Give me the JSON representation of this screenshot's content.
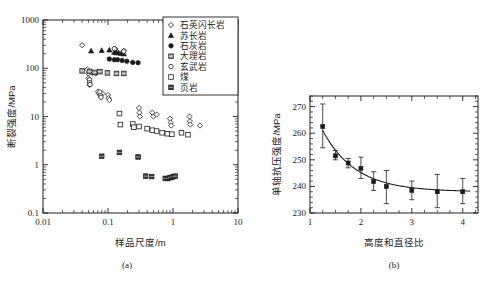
{
  "figure": {
    "panel_a_caption": "(a)",
    "panel_b_caption": "(b)"
  },
  "chart_data": [
    {
      "id": "panel_a",
      "type": "scatter",
      "title": "",
      "xlabel": "样品尺度/m",
      "ylabel": "断裂强度/MPa",
      "xscale": "log",
      "yscale": "log",
      "xlim": [
        0.01,
        10
      ],
      "ylim": [
        0.1,
        1000
      ],
      "xticklabels": [
        "0.01",
        "0.1",
        "1",
        "10"
      ],
      "xtickvalues": [
        0.01,
        0.1,
        1,
        10
      ],
      "yticklabels": [
        "1000",
        "100",
        "10",
        "1",
        "0.1"
      ],
      "ytickvalues": [
        1000,
        100,
        10,
        1,
        0.1
      ],
      "grid": false,
      "legend_position": "top-right",
      "series": [
        {
          "name": "石英闪长岩",
          "marker": "open-diamond",
          "points": [
            [
              0.04,
              300
            ],
            [
              0.048,
              95
            ],
            [
              0.05,
              78
            ],
            [
              0.05,
              62
            ],
            [
              0.052,
              52
            ],
            [
              0.052,
              45
            ],
            [
              0.055,
              85
            ],
            [
              0.058,
              80
            ],
            [
              0.065,
              78
            ],
            [
              0.07,
              33
            ],
            [
              0.072,
              30
            ],
            [
              0.075,
              28
            ],
            [
              0.082,
              30
            ],
            [
              0.1,
              28
            ],
            [
              0.102,
              24
            ],
            [
              0.105,
              22
            ],
            [
              0.13,
              250
            ],
            [
              0.175,
              230
            ],
            [
              0.3,
              15
            ],
            [
              0.305,
              12
            ],
            [
              0.31,
              10
            ],
            [
              0.48,
              12
            ],
            [
              0.5,
              10
            ],
            [
              0.56,
              11
            ],
            [
              0.9,
              9
            ],
            [
              0.92,
              7.5
            ],
            [
              0.94,
              6.5
            ],
            [
              1.8,
              10
            ],
            [
              1.82,
              8
            ],
            [
              1.85,
              6.8
            ],
            [
              2.6,
              6.5
            ]
          ]
        },
        {
          "name": "苏长岩",
          "marker": "filled-triangle",
          "points": [
            [
              0.055,
              230
            ],
            [
              0.08,
              235
            ],
            [
              0.105,
              240
            ],
            [
              0.125,
              215
            ],
            [
              0.135,
              210
            ],
            [
              0.145,
              212
            ],
            [
              0.16,
              205
            ],
            [
              0.175,
              200
            ]
          ]
        },
        {
          "name": "石灰岩",
          "marker": "filled-circle",
          "points": [
            [
              0.105,
              155
            ],
            [
              0.125,
              150
            ],
            [
              0.14,
              150
            ],
            [
              0.165,
              145
            ],
            [
              0.195,
              140
            ],
            [
              0.24,
              132
            ],
            [
              0.29,
              130
            ]
          ]
        },
        {
          "name": "大理岩",
          "marker": "hatched-square",
          "points": [
            [
              0.04,
              88
            ],
            [
              0.052,
              86
            ],
            [
              0.062,
              82
            ],
            [
              0.075,
              85
            ],
            [
              0.098,
              80
            ],
            [
              0.135,
              78
            ],
            [
              0.175,
              78
            ]
          ]
        },
        {
          "name": "玄武岩",
          "marker": "open-circle",
          "points": [
            [
              0.125,
              255
            ],
            [
              0.175,
              225
            ],
            [
              0.052,
              58
            ],
            [
              0.052,
              50
            ],
            [
              0.053,
              46
            ],
            [
              0.075,
              32
            ],
            [
              0.077,
              27
            ],
            [
              0.078,
              25
            ]
          ]
        },
        {
          "name": "煤",
          "marker": "open-square",
          "points": [
            [
              0.15,
              11.5
            ],
            [
              0.155,
              6.8
            ],
            [
              0.24,
              7.0
            ],
            [
              0.25,
              6.0
            ],
            [
              0.3,
              6.2
            ],
            [
              0.4,
              5.6
            ],
            [
              0.48,
              5.2
            ],
            [
              0.56,
              5.0
            ],
            [
              0.68,
              4.6
            ],
            [
              0.82,
              4.4
            ],
            [
              0.96,
              4.3
            ],
            [
              1.35,
              4.6
            ],
            [
              1.7,
              4.2
            ]
          ]
        },
        {
          "name": "页岩",
          "marker": "filled-patterned-square",
          "points": [
            [
              0.08,
              1.5
            ],
            [
              0.15,
              1.8
            ],
            [
              0.29,
              1.45
            ],
            [
              0.38,
              0.58
            ],
            [
              0.47,
              0.57
            ],
            [
              0.76,
              0.52
            ],
            [
              0.83,
              0.52
            ],
            [
              0.9,
              0.54
            ],
            [
              0.96,
              0.55
            ],
            [
              1.02,
              0.57
            ],
            [
              1.08,
              0.58
            ]
          ]
        }
      ]
    },
    {
      "id": "panel_b",
      "type": "line",
      "title": "",
      "xlabel": "高度和直径比",
      "ylabel": "单轴抗压强度/MPa",
      "xscale": "linear",
      "yscale": "linear",
      "xlim": [
        1,
        4.3
      ],
      "ylim": [
        230,
        274
      ],
      "xticklabels": [
        "1",
        "2",
        "3",
        "4"
      ],
      "xtickvalues": [
        1,
        2,
        3,
        4
      ],
      "yticklabels": [
        "230",
        "240",
        "250",
        "260",
        "270"
      ],
      "ytickvalues": [
        230,
        240,
        250,
        260,
        270
      ],
      "grid": false,
      "marker": "filled-square",
      "x": [
        1.25,
        1.5,
        1.75,
        2.0,
        2.25,
        2.5,
        3.0,
        3.5,
        4.0
      ],
      "values": [
        262.5,
        251.5,
        248.8,
        246.8,
        241.8,
        240.0,
        238.5,
        238.0,
        238.0
      ],
      "yerr_upper": [
        271.0,
        253.5,
        250.5,
        251.0,
        245.5,
        246.0,
        242.0,
        244.5,
        243.0
      ],
      "yerr_lower": [
        254.5,
        250.0,
        247.0,
        243.0,
        238.5,
        233.5,
        235.0,
        232.0,
        233.5
      ],
      "fit_curve_note": "decaying curve through means, flattening near 238"
    }
  ]
}
